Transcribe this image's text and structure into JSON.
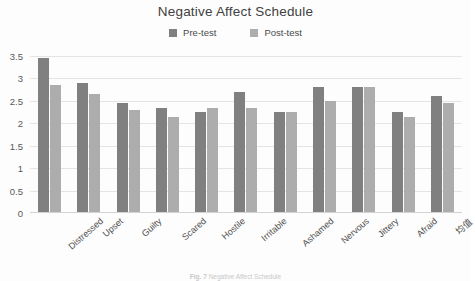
{
  "chart_data": {
    "type": "bar",
    "title": "Negative Affect Schedule",
    "xlabel": "",
    "ylabel": "",
    "ylim": [
      0,
      3.5
    ],
    "yticks": [
      "0",
      "0.5",
      "1",
      "1.5",
      "2",
      "2.5",
      "3",
      "3.5"
    ],
    "ytick_values": [
      0,
      0.5,
      1,
      1.5,
      2,
      2.5,
      3,
      3.5
    ],
    "grid": true,
    "legend_position": "top-center",
    "categories": [
      "Distressed",
      "Upset",
      "Guilty",
      "Scared",
      "Hostile",
      "Irritable",
      "Ashamed",
      "Nervous",
      "Jittery",
      "Afraid",
      "均值"
    ],
    "series": [
      {
        "name": "Pre-test",
        "color": "#808080",
        "values": [
          3.45,
          2.9,
          2.45,
          2.35,
          2.25,
          2.7,
          2.25,
          2.8,
          2.8,
          2.25,
          2.6
        ]
      },
      {
        "name": "Post-test",
        "color": "#adadad",
        "values": [
          2.85,
          2.65,
          2.3,
          2.15,
          2.35,
          2.35,
          2.25,
          2.5,
          2.8,
          2.15,
          2.45
        ]
      }
    ]
  },
  "caption": {
    "label": "Fig. 7",
    "text": "Negative Affect Schedule"
  }
}
